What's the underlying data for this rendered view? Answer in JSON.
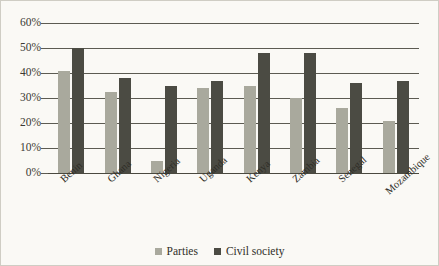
{
  "chart_data": {
    "type": "bar",
    "title": "",
    "subtitle": "",
    "xlabel": "",
    "ylabel": "",
    "ylim": [
      0,
      60
    ],
    "ytick_values": [
      0,
      10,
      20,
      30,
      40,
      50,
      60
    ],
    "ytick_labels": [
      "0%",
      "10%",
      "20%",
      "30%",
      "40%",
      "50%",
      "60%"
    ],
    "grid": true,
    "legend_position": "bottom-center",
    "categories": [
      "Benin",
      "Ghana",
      "Nigeria",
      "Uganda",
      "Kenya",
      "Zambia",
      "Senegal",
      "Mozambique"
    ],
    "series": [
      {
        "name": "Parties",
        "color": "#a9a99d",
        "values": [
          41,
          32.5,
          5,
          34,
          35,
          30,
          26,
          21
        ]
      },
      {
        "name": "Civil society",
        "color": "#4b4b43",
        "values": [
          50,
          38,
          35,
          37,
          48,
          48,
          36,
          37
        ]
      }
    ]
  },
  "legend": {
    "entries": [
      {
        "label": "Parties",
        "swatch": "parties"
      },
      {
        "label": "Civil society",
        "swatch": "civil"
      }
    ]
  },
  "colors": {
    "background": "#faf9f5",
    "border": "#cfcdc4",
    "gridline": "#5c5b52",
    "axis_text": "#3b3a33",
    "parties": "#a9a99d",
    "civil_society": "#4b4b43"
  }
}
